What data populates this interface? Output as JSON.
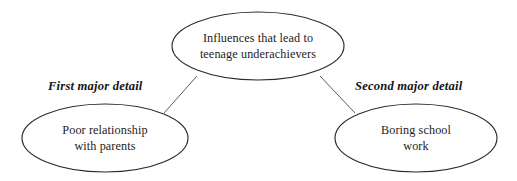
{
  "diagram": {
    "type": "cluster-map",
    "background_color": "#ffffff",
    "stroke_color": "#2b2b2b",
    "text_color": "#1c1c1c",
    "connector_color": "#4a4a4a",
    "nodes": [
      {
        "id": "central-topic",
        "role": "central",
        "lines": [
          "Influences that lead to",
          "teenage underachievers"
        ],
        "line1": "Influences that lead to",
        "line2": "teenage underachievers",
        "cx": 258,
        "cy": 46,
        "rx": 86,
        "ry": 34
      },
      {
        "id": "detail-left",
        "role": "detail",
        "lines": [
          "Poor relationship",
          "with parents"
        ],
        "line1": "Poor relationship",
        "line2": "with parents",
        "cx": 105,
        "cy": 138,
        "rx": 83,
        "ry": 34
      },
      {
        "id": "detail-right",
        "role": "detail",
        "lines": [
          "Boring school",
          "work"
        ],
        "line1": "Boring school",
        "line2": "work",
        "cx": 416,
        "cy": 138,
        "rx": 81,
        "ry": 34
      }
    ],
    "connectors": [
      {
        "id": "connector-left",
        "from": "central-topic",
        "to": "detail-left",
        "label": "First major detail",
        "label_x": 48,
        "label_y": 90,
        "x1": 197,
        "y1": 76,
        "x2": 164,
        "y2": 113
      },
      {
        "id": "connector-right",
        "from": "central-topic",
        "to": "detail-right",
        "label": "Second major detail",
        "label_x": 355,
        "label_y": 90,
        "x1": 320,
        "y1": 76,
        "x2": 355,
        "y2": 113
      }
    ]
  }
}
